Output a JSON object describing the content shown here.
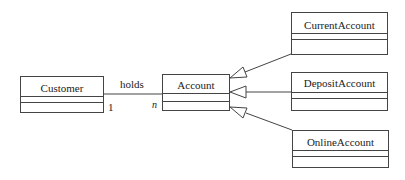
{
  "diagram": {
    "type": "UML class diagram",
    "classes": [
      {
        "id": "customer",
        "name": "Customer"
      },
      {
        "id": "account",
        "name": "Account"
      },
      {
        "id": "current",
        "name": "CurrentAccount"
      },
      {
        "id": "deposit",
        "name": "DepositAccount"
      },
      {
        "id": "online",
        "name": "OnlineAccount"
      }
    ],
    "association": {
      "label": "holds",
      "from": "Customer",
      "to": "Account",
      "from_multiplicity": "1",
      "to_multiplicity": "n"
    },
    "generalizations": [
      {
        "child": "CurrentAccount",
        "parent": "Account"
      },
      {
        "child": "DepositAccount",
        "parent": "Account"
      },
      {
        "child": "OnlineAccount",
        "parent": "Account"
      }
    ],
    "colors": {
      "line": "#444444",
      "text": "#222222",
      "background": "#ffffff"
    }
  }
}
